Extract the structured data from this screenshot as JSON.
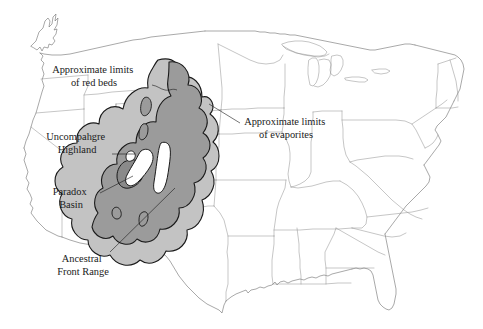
{
  "figure": {
    "kind": "geologic-map",
    "region": "conterminous-united-states",
    "background_color": "#ffffff",
    "outline_color": "#8c8c8c"
  },
  "legend_colors": {
    "evaporites_fill": "#c3c3c3",
    "red_beds_fill": "#9b9b9b",
    "paradox_basin_fill": "#8a8a8a",
    "uplift_fill": "#ffffff",
    "boundary_stroke": "#1a1a1a"
  },
  "labels": [
    {
      "id": "approximate-limits-of-red-beds",
      "lines": [
        "Approximate limits",
        "of red beds"
      ],
      "x": 94,
      "y": 73,
      "leader": "M 152 85 C 158 86 160 89 165 90 C 170 91 172 88 177 90"
    },
    {
      "id": "approximate-limits-of-evaporites",
      "lines": [
        "Approximate limits",
        "of evaporites"
      ],
      "x": 286,
      "y": 125,
      "leader": "M 240 123 L 209 104"
    },
    {
      "id": "uncompahgre-highland",
      "lines": [
        "Uncompahgre",
        "Highland"
      ],
      "x": 77,
      "y": 140,
      "leader": "M 112 154 L 135 154"
    },
    {
      "id": "paradox-basin",
      "lines": [
        "Paradox",
        "Basin"
      ],
      "x": 71,
      "y": 195,
      "leader": "M 100 193 L 133 176"
    },
    {
      "id": "ancestral-front-range",
      "lines": [
        "Ancestral",
        "Front Range"
      ],
      "x": 83,
      "y": 262,
      "leader": "M 110 252 L 175 188"
    }
  ],
  "map_areas": [
    {
      "id": "evaporites-extent",
      "name": "Approximate limits of evaporites",
      "fill": "#c3c3c3",
      "stroke": "#1a1a1a"
    },
    {
      "id": "red-beds-extent",
      "name": "Approximate limits of red beds",
      "fill": "#9b9b9b",
      "stroke": "#1a1a1a"
    },
    {
      "id": "paradox-basin-area",
      "name": "Paradox Basin",
      "fill": "#8a8a8a",
      "stroke": "#1a1a1a"
    },
    {
      "id": "uncompahgre-highland-uplift",
      "name": "Uncompahgre Highland",
      "fill": "#ffffff",
      "stroke": "#1a1a1a"
    },
    {
      "id": "ancestral-front-range-uplift",
      "name": "Ancestral Front Range",
      "fill": "#ffffff",
      "stroke": "#1a1a1a"
    }
  ]
}
